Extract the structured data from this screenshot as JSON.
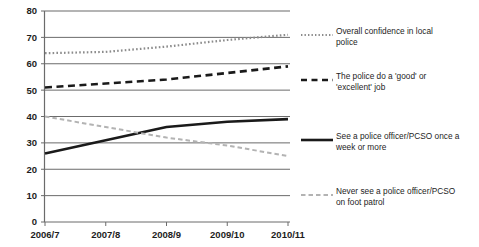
{
  "chart_data": {
    "type": "line",
    "title": "",
    "subtitle": "",
    "xlabel": "",
    "ylabel": "",
    "categories": [
      "2006/7",
      "2007/8",
      "2008/9",
      "2009/10",
      "2010/11"
    ],
    "ylim": [
      0,
      80
    ],
    "ytick_step": 10,
    "yticks": [
      "80",
      "70",
      "60",
      "50",
      "40",
      "30",
      "20",
      "10",
      "0"
    ],
    "grid": "horizontal",
    "legend_position": "right",
    "series": [
      {
        "name": "Overall confidence in local police",
        "style": "dotted",
        "color": "#8c8c8c",
        "values": [
          64,
          64.5,
          66.5,
          69,
          71
        ]
      },
      {
        "name": "The police do a 'good' or 'excellent' job",
        "style": "dashed",
        "color": "#1a1a1a",
        "values": [
          51,
          52.5,
          54,
          56.5,
          59
        ]
      },
      {
        "name": "See a police officer/PCSO once a week or more",
        "style": "solid",
        "color": "#1a1a1a",
        "values": [
          26,
          31,
          36,
          38,
          39
        ]
      },
      {
        "name": "Never see a police officer/PCSO on foot patrol",
        "style": "dash-light",
        "color": "#b3b3b3",
        "values": [
          40,
          36,
          32,
          29,
          25
        ]
      }
    ]
  },
  "legend": {
    "items": [
      {
        "label": "Overall confidence in local\npolice",
        "swatch": "dotted-line-swatch"
      },
      {
        "label": "The police do a 'good' or\n'excellent' job",
        "swatch": "dashed-line-swatch"
      },
      {
        "label": "See a police officer/PCSO once a\nweek or more",
        "swatch": "solid-line-swatch"
      },
      {
        "label": "Never see a police officer/PCSO\non foot patrol",
        "swatch": "light-dashed-line-swatch"
      }
    ]
  },
  "axis": {
    "y_labels": [
      "80",
      "70",
      "60",
      "50",
      "40",
      "30",
      "20",
      "10",
      "0"
    ],
    "x_labels": [
      "2006/7",
      "2007/8",
      "2008/9",
      "2009/10",
      "2010/11"
    ]
  },
  "colors": {
    "grid": "#6b6b6b",
    "axis": "#6b6b6b",
    "dark_series": "#1a1a1a",
    "mid_series": "#8c8c8c",
    "light_series": "#b3b3b3",
    "text": "#1d1d1d",
    "background": "#ffffff"
  }
}
